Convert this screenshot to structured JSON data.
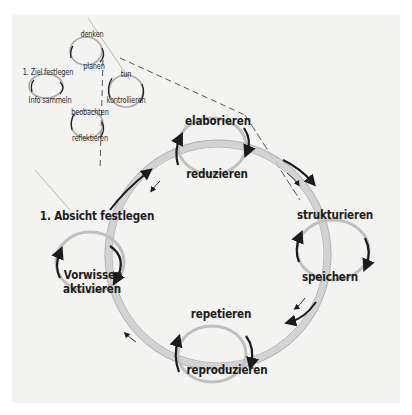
{
  "diagram": {
    "type": "learning-cycle-sketch",
    "small_cycle": {
      "labels": {
        "denken": "denken",
        "planen": "planen",
        "ziel": "1. Ziel festlegen",
        "info": "Info sammeln",
        "tun": "tun",
        "kontrollieren": "kontrollieren",
        "beobachten": "beobachten",
        "reflektieren": "reflektieren"
      }
    },
    "main_cycle": {
      "labels": {
        "elaborieren": "elaborieren",
        "reduzieren": "reduzieren",
        "strukturieren": "strukturieren",
        "speichern": "speichern",
        "repetieren": "repetieren",
        "reproduzieren": "reproduzieren",
        "absicht": "1. Absicht festlegen",
        "vorwissen_1": "Vorwissen",
        "vorwissen_2": "aktivieren"
      }
    },
    "colors": {
      "paper": "#f3f3f2",
      "ink": "#1c1c1c",
      "pencil": "#c8c8c8"
    }
  }
}
